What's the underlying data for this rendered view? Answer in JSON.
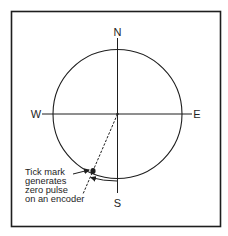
{
  "diagram": {
    "compass": {
      "north": "N",
      "south": "S",
      "east": "E",
      "west": "W"
    },
    "annotation": {
      "lines": [
        "Tick mark",
        "generates",
        "zero pulse",
        "on an encoder"
      ]
    },
    "colors": {
      "stroke": "#1e1e1e",
      "background": "#ffffff"
    }
  }
}
